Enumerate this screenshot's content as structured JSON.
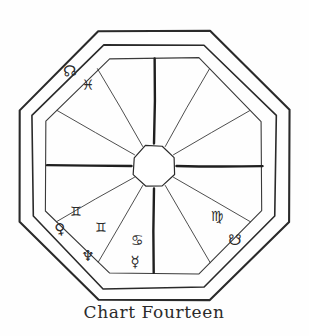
{
  "figure": {
    "title": "Chart Fourteen",
    "caption": "Chart Fourteen",
    "type": "astrological-natal-chart",
    "shape": "octagon",
    "ink_color": "#2a2a2a",
    "background_color": "#fefefe",
    "house_count": 12
  },
  "symbols": {
    "north_node": "☊",
    "pisces": "♓",
    "gemini": "♊",
    "venus": "♀",
    "neptune": "♆",
    "cancer": "♋",
    "mercury": "☿",
    "virgo": "♍",
    "south_node": "☋"
  },
  "placements": [
    {
      "name": "north-node",
      "glyph": "☊",
      "label": "North Node",
      "x": 70,
      "y": 71,
      "size": 15,
      "rotate": -8
    },
    {
      "name": "pisces",
      "glyph": "♓",
      "label": "Pisces",
      "x": 88,
      "y": 85,
      "size": 14,
      "rotate": 0
    },
    {
      "name": "gemini-upper",
      "glyph": "♊",
      "label": "Gemini",
      "x": 76,
      "y": 211,
      "size": 13,
      "rotate": 0
    },
    {
      "name": "venus",
      "glyph": "♀",
      "label": "Venus",
      "x": 60,
      "y": 229,
      "size": 15,
      "rotate": -12
    },
    {
      "name": "gemini-lower",
      "glyph": "♊",
      "label": "Gemini",
      "x": 101,
      "y": 227,
      "size": 13,
      "rotate": 0
    },
    {
      "name": "neptune",
      "glyph": "♆",
      "label": "Neptune",
      "x": 88,
      "y": 256,
      "size": 15,
      "rotate": 0
    },
    {
      "name": "cancer",
      "glyph": "♋",
      "label": "Cancer",
      "x": 137,
      "y": 240,
      "size": 14,
      "rotate": 0
    },
    {
      "name": "mercury",
      "glyph": "☿",
      "label": "Mercury",
      "x": 135,
      "y": 262,
      "size": 15,
      "rotate": 0
    },
    {
      "name": "virgo",
      "glyph": "♍",
      "label": "Virgo",
      "x": 217,
      "y": 216,
      "size": 14,
      "rotate": 0
    },
    {
      "name": "south-node",
      "glyph": "☋",
      "label": "South Node",
      "x": 235,
      "y": 240,
      "size": 15,
      "rotate": 0
    }
  ],
  "geometry": {
    "center": {
      "x": 154,
      "y": 166
    },
    "outer_octagon_radius": 146,
    "inner_octagon_radius": 132,
    "house_ring_radius": 117,
    "core_octagon_radius": 22,
    "thick_stroke": 2.1,
    "thin_stroke": 0.9,
    "axis_stroke": 2.4
  }
}
